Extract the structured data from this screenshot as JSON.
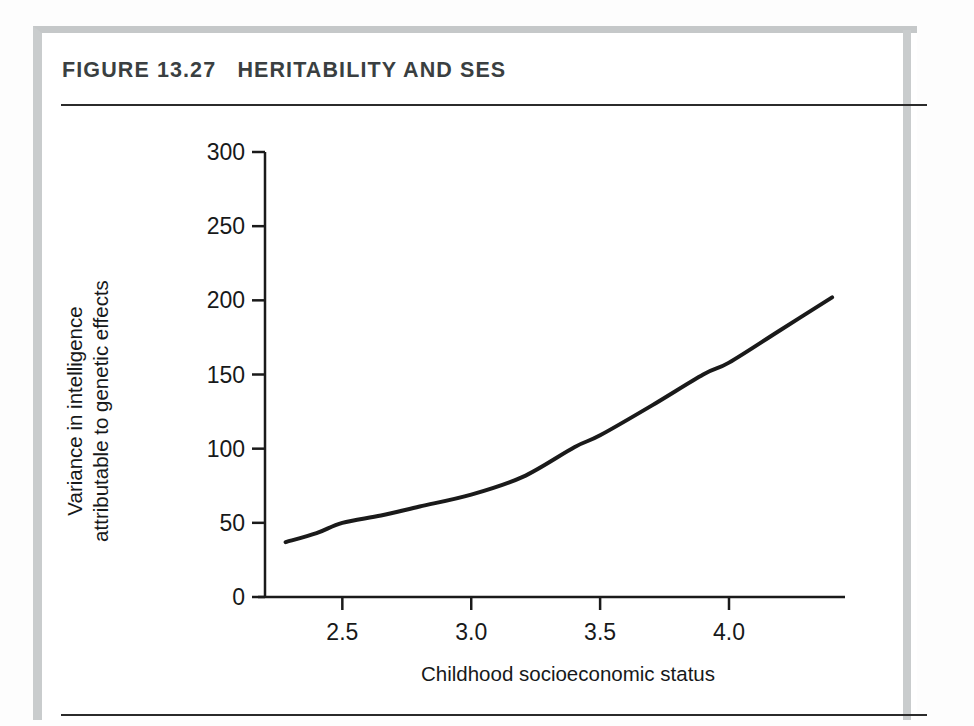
{
  "figure": {
    "title": "FIGURE 13.27   HERITABILITY AND SES",
    "label_prefix": "FIGURE 13.27",
    "label_text": "HERITABILITY AND SES"
  },
  "background_text": {
    "lines": [
      "for various lifetime different type of the environment and the",
      "cultural context. they gradually build these resources to form",
      "environments of their own, to developmental, and they",
      "and 1990).",
      "Because of the",
      "influence on intelligence is stronger for children from",
      "poorer families, and correlates of intelligence appear more",
      "substantial in families of higher socioeconomic status than",
      "lower. In contrast, the heritability of intelligence appears",
      "population can be less predictable in children of low SES."
    ]
  },
  "chart_data": {
    "type": "line",
    "title": "HERITABILITY AND SES",
    "xlabel": "Childhood socioeconomic status",
    "ylabel": "Variance in intelligence\nattributable to genetic effects",
    "ylabel_line1": "Variance in intelligence",
    "ylabel_line2": "attributable to genetic effects",
    "xlim": [
      2.2,
      4.45
    ],
    "ylim": [
      0,
      300
    ],
    "xticks": [
      2.5,
      3.0,
      3.5,
      4.0
    ],
    "xtick_labels": [
      "2.5",
      "3.0",
      "3.5",
      "4.0"
    ],
    "yticks": [
      0,
      50,
      100,
      150,
      200,
      250,
      300
    ],
    "ytick_labels": [
      "0",
      "50",
      "100",
      "150",
      "200",
      "250",
      "300"
    ],
    "grid": false,
    "legend": null,
    "series": [
      {
        "name": "Genetic variance",
        "color": "#1a1a1a",
        "linewidth": 4,
        "x": [
          2.28,
          2.4,
          2.5,
          2.65,
          2.8,
          3.0,
          3.2,
          3.4,
          3.5,
          3.7,
          3.9,
          4.0,
          4.2,
          4.4
        ],
        "y": [
          37,
          43,
          50,
          55,
          61,
          69,
          81,
          101,
          109,
          129,
          150,
          158,
          180,
          202
        ]
      }
    ]
  }
}
